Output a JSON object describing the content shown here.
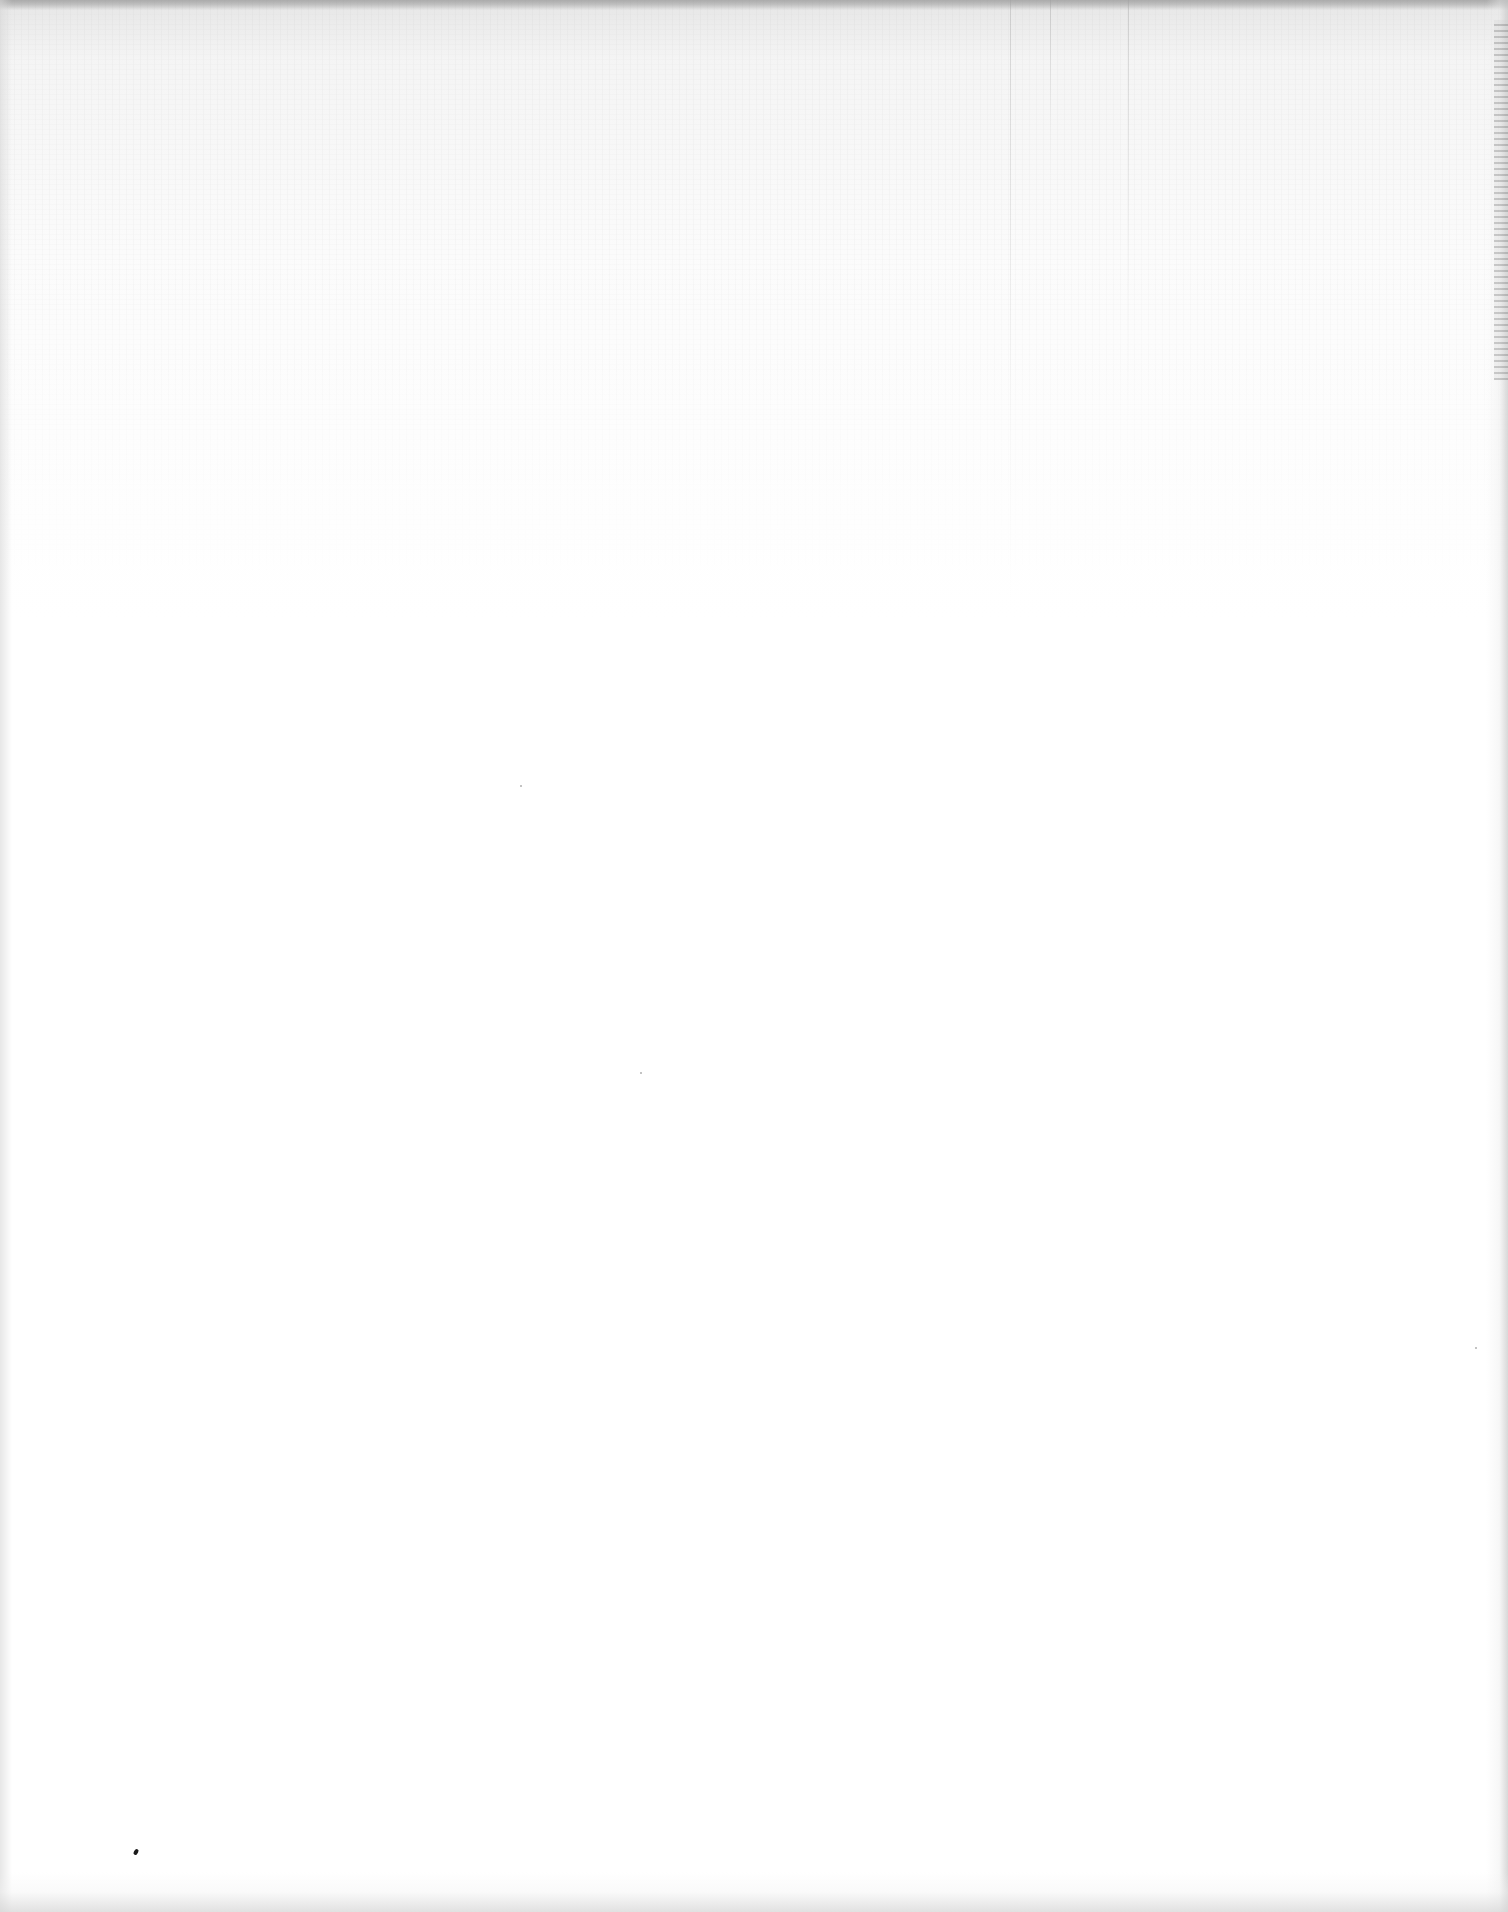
{
  "page": {
    "type": "blank-scanned-page",
    "text_content": "",
    "background_color": "#ffffff",
    "scan_noise_color": "#c8c8c8",
    "edge_shadow_color": "#d0d0d0"
  },
  "artifacts": {
    "ink_speck": {
      "x": 136,
      "y": 1852,
      "color": "#1a1a1a"
    },
    "faint_dots": [
      {
        "x": 520,
        "y": 785
      },
      {
        "x": 640,
        "y": 1072
      },
      {
        "x": 1475,
        "y": 1347
      }
    ]
  }
}
